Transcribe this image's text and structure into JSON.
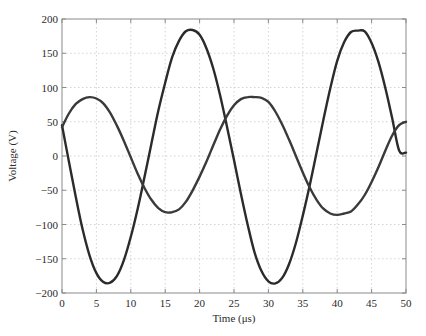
{
  "chart_data": {
    "type": "line",
    "title": "",
    "xlabel": "Time (μs)",
    "ylabel": "Voltage (V)",
    "xlim": [
      0,
      50
    ],
    "ylim": [
      -200,
      200
    ],
    "xticks": [
      0,
      5,
      10,
      15,
      20,
      25,
      30,
      35,
      40,
      45,
      50
    ],
    "yticks": [
      200,
      150,
      100,
      50,
      0,
      -50,
      -100,
      -150,
      -200
    ],
    "xtick_labels": [
      "0",
      "5",
      "10",
      "15",
      "20",
      "25",
      "30",
      "35",
      "40",
      "45",
      "50"
    ],
    "ytick_labels": [
      "200",
      "150",
      "100",
      "50",
      "0",
      "−50",
      "−100",
      "−150",
      "−200"
    ],
    "grid": true,
    "grid_style": "dotted",
    "legend": "none",
    "series": [
      {
        "name": "Voltage waveform A (large amplitude)",
        "color": "#2b2b2b",
        "x": [
          0,
          1,
          2,
          3,
          4,
          5,
          6,
          7,
          8,
          9,
          10,
          11,
          12,
          13,
          14,
          15,
          16,
          17,
          18,
          19,
          20,
          21,
          22,
          23,
          24,
          25,
          26,
          27,
          28,
          29,
          30,
          31,
          32,
          33,
          34,
          35,
          36,
          37,
          38,
          39,
          40,
          41,
          42,
          43,
          44,
          45,
          46,
          47,
          48,
          49,
          50
        ],
        "values": [
          45,
          -8,
          -60,
          -107,
          -145,
          -171,
          -184,
          -185,
          -175,
          -152,
          -118,
          -77,
          -30,
          18,
          66,
          107,
          144,
          168,
          182,
          184,
          177,
          157,
          127,
          88,
          42,
          -6,
          -55,
          -101,
          -141,
          -168,
          -183,
          -186,
          -178,
          -158,
          -127,
          -87,
          -43,
          5,
          53,
          99,
          139,
          166,
          181,
          183,
          182,
          165,
          137,
          99,
          55,
          8,
          5
        ]
      },
      {
        "name": "Voltage waveform B (small amplitude)",
        "color": "#3a3a3a",
        "x": [
          0,
          1,
          2,
          3,
          4,
          5,
          6,
          7,
          8,
          9,
          10,
          11,
          12,
          13,
          14,
          15,
          16,
          17,
          18,
          19,
          20,
          21,
          22,
          23,
          24,
          25,
          26,
          27,
          28,
          29,
          30,
          31,
          32,
          33,
          34,
          35,
          36,
          37,
          38,
          39,
          40,
          41,
          42,
          43,
          44,
          45,
          46,
          47,
          48,
          49,
          50
        ],
        "values": [
          42,
          62,
          76,
          83,
          86,
          84,
          77,
          63,
          44,
          22,
          -2,
          -26,
          -47,
          -64,
          -76,
          -82,
          -82,
          -78,
          -67,
          -50,
          -30,
          -8,
          16,
          39,
          59,
          74,
          83,
          86,
          86,
          85,
          79,
          65,
          46,
          24,
          0,
          -24,
          -46,
          -64,
          -77,
          -84,
          -86,
          -84,
          -81,
          -71,
          -57,
          -38,
          -16,
          8,
          30,
          45,
          50
        ]
      }
    ]
  }
}
